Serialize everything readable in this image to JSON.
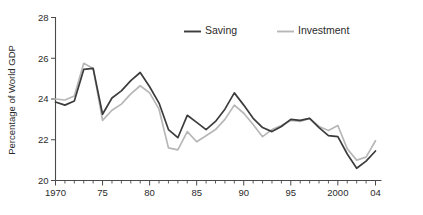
{
  "chart_data": {
    "type": "line",
    "title": "",
    "subtitle": "",
    "xlabel": "",
    "ylabel": "Percentage of World GDP",
    "xlim": [
      1970,
      2004
    ],
    "ylim": [
      20,
      28
    ],
    "grid": false,
    "legend_position": "top-center",
    "y_ticks": [
      20,
      22,
      24,
      26,
      28
    ],
    "y_tick_labels": [
      "20",
      "22",
      "24",
      "26",
      "28"
    ],
    "x_ticks": [
      1970,
      1975,
      1980,
      1985,
      1990,
      1995,
      2000,
      2004
    ],
    "x_tick_labels": [
      "1970",
      "75",
      "80",
      "85",
      "90",
      "95",
      "2000",
      "04"
    ],
    "x_minor_tick_step": 1,
    "x": [
      1970,
      1971,
      1972,
      1973,
      1974,
      1975,
      1976,
      1977,
      1978,
      1979,
      1980,
      1981,
      1982,
      1983,
      1984,
      1985,
      1986,
      1987,
      1988,
      1989,
      1990,
      1991,
      1992,
      1993,
      1994,
      1995,
      1996,
      1997,
      1998,
      1999,
      2000,
      2001,
      2002,
      2003,
      2004
    ],
    "series": [
      {
        "name": "Saving",
        "color": "#3c3c3c",
        "values": [
          23.85,
          23.7,
          23.9,
          25.45,
          25.5,
          23.25,
          24.05,
          24.4,
          24.9,
          25.3,
          24.6,
          23.8,
          22.5,
          22.1,
          23.2,
          22.85,
          22.5,
          22.9,
          23.5,
          24.3,
          23.7,
          23.05,
          22.6,
          22.4,
          22.65,
          23.0,
          22.95,
          23.05,
          22.6,
          22.2,
          22.15,
          21.3,
          20.6,
          20.95,
          21.45
        ]
      },
      {
        "name": "Investment",
        "color": "#b7b7b7",
        "values": [
          24.0,
          23.95,
          24.15,
          25.75,
          25.5,
          22.95,
          23.45,
          23.75,
          24.25,
          24.65,
          24.3,
          23.5,
          21.6,
          21.5,
          22.4,
          21.9,
          22.2,
          22.5,
          23.0,
          23.7,
          23.3,
          22.75,
          22.15,
          22.5,
          22.7,
          22.95,
          22.9,
          23.05,
          22.65,
          22.45,
          22.7,
          21.55,
          21.0,
          21.15,
          21.95
        ]
      }
    ]
  },
  "legend": {
    "items": [
      {
        "label": "Saving",
        "color": "#3c3c3c"
      },
      {
        "label": "Investment",
        "color": "#b7b7b7"
      }
    ]
  },
  "axes": {
    "y_axis_title": "Percentage of World GDP"
  }
}
